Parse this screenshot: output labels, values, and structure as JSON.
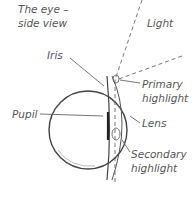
{
  "title": {
    "line1": "The eye –",
    "line2": "side view"
  },
  "labels": {
    "light": "Light",
    "iris": "Iris",
    "pupil": "Pupil",
    "primary_1": "Primary",
    "primary_2": "highlight",
    "lens": "Lens",
    "secondary_1": "Secondary",
    "secondary_2": "highlight"
  },
  "colors": {
    "stroke": "#555555",
    "text": "#555555",
    "background": "#ffffff"
  }
}
